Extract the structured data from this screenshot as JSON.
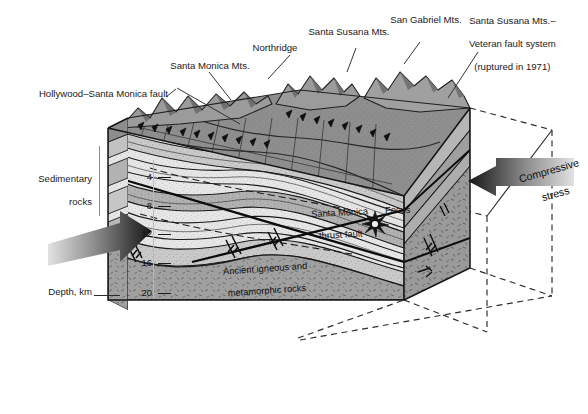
{
  "figure": {
    "type": "geologic-block-diagram",
    "orientation": "3D cutaway block, view from southwest"
  },
  "callouts": {
    "hollywood_fault": "Hollywood–Santa Monica fault",
    "santa_monica_mts": "Santa Monica Mts.",
    "northridge": "Northridge",
    "santa_susana_mts": "Santa Susana Mts.",
    "san_gabriel_mts": "San Gabriel Mts.",
    "veteran_fault_line1": "Santa Susana Mts.–",
    "veteran_fault_line2": "Veteran fault system",
    "veteran_fault_line3": "(ruptured in 1971)"
  },
  "side_labels": {
    "sedimentary_line1": "Sedimentary",
    "sedimentary_line2": "rocks",
    "depth_axis": "Depth, km"
  },
  "in_block_labels": {
    "thrust_fault_line1": "Santa Monica",
    "thrust_fault_line2": "thrust fault",
    "focus": "Focus",
    "basement_line1": "Ancient igneous and",
    "basement_line2": "metamorphic rocks"
  },
  "stress": {
    "line1": "Compressive",
    "line2": "stress"
  },
  "depth_scale": {
    "unit": "km",
    "ticks": [
      "4",
      "8",
      "12",
      "16",
      "20"
    ]
  },
  "colors": {
    "ink": "#1a1a1a",
    "top_surface": "#8e8e8e",
    "mountains": "#9a9a9a",
    "sediment_light": "#e4e4e4",
    "sediment_mid": "#c9c9c9",
    "sediment_dark": "#b0b0b0",
    "basement": "#9d9d9d",
    "right_face": "#9b9b9b",
    "arrow_dark": "#1e1e1e",
    "arrow_light": "#d8d8d8",
    "dashed": "#2a2a2a"
  }
}
